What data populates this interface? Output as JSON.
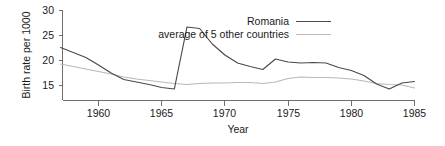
{
  "chart_data": {
    "type": "line",
    "title": "",
    "xlabel": "Year",
    "ylabel": "Birth rate per 1000",
    "xlim": [
      1957,
      1985
    ],
    "ylim": [
      11,
      30
    ],
    "grid": false,
    "legend_position": "top-right",
    "xticks": [
      1960,
      1965,
      1970,
      1975,
      1980,
      1985
    ],
    "yticks": [
      15,
      20,
      25,
      30
    ],
    "x": [
      1957,
      1958,
      1959,
      1960,
      1961,
      1962,
      1963,
      1964,
      1965,
      1966,
      1967,
      1968,
      1969,
      1970,
      1971,
      1972,
      1973,
      1974,
      1975,
      1976,
      1977,
      1978,
      1979,
      1980,
      1981,
      1982,
      1983,
      1984,
      1985
    ],
    "series": [
      {
        "name": "Romania",
        "color": "#4a4a4a",
        "values": [
          22.6,
          21.6,
          20.6,
          19.1,
          17.5,
          16.2,
          15.7,
          15.2,
          14.6,
          14.3,
          26.7,
          26.4,
          23.3,
          21.1,
          19.5,
          18.8,
          18.2,
          20.3,
          19.7,
          19.5,
          19.6,
          19.5,
          18.6,
          18.0,
          17.0,
          15.3,
          14.3,
          15.5,
          15.8
        ],
        "linewidth": 1.15
      },
      {
        "name": "average of 5 other countries",
        "color": "#b8b8b8",
        "values": [
          19.3,
          18.8,
          18.3,
          17.8,
          17.3,
          16.7,
          16.3,
          16.0,
          15.7,
          15.4,
          15.2,
          15.4,
          15.5,
          15.5,
          15.6,
          15.6,
          15.4,
          15.7,
          16.4,
          16.7,
          16.6,
          16.6,
          16.5,
          16.3,
          15.9,
          15.4,
          15.2,
          15.1,
          14.5
        ],
        "linewidth": 1.15
      }
    ],
    "annotations": []
  },
  "axes": {
    "y_axis_title": "Birth rate per 1000",
    "x_axis_title": "Year",
    "y_tick_labels": [
      "30",
      "25",
      "20",
      "15"
    ],
    "x_tick_labels": [
      "1960",
      "1965",
      "1970",
      "1975",
      "1980",
      "1985"
    ]
  },
  "legend": {
    "entries": [
      {
        "label": "Romania",
        "color": "#4a4a4a"
      },
      {
        "label": "average of 5 other countries",
        "color": "#b8b8b8"
      }
    ]
  },
  "colors": {
    "romania_line": "#4a4a4a",
    "average_line": "#b8b8b8",
    "axis": "#6e6e6e",
    "text": "#1a1a1a",
    "background": "#ffffff"
  }
}
